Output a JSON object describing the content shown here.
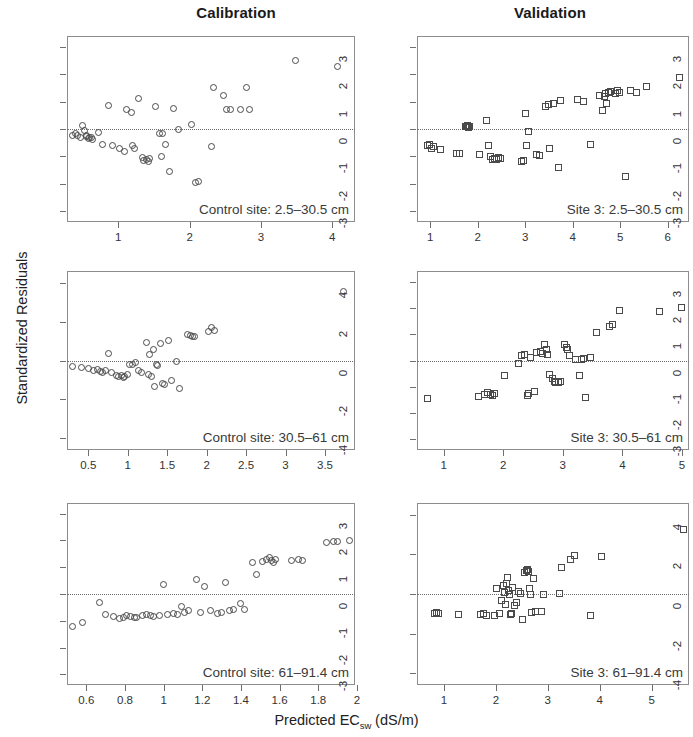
{
  "figure": {
    "column_titles": [
      "Calibration",
      "Validation"
    ],
    "ylabel": "Standardized Residuals",
    "xlabel_main": "Predicted EC",
    "xlabel_sub": "sw",
    "xlabel_unit": " (dS/m)"
  },
  "chart_data": [
    {
      "type": "scatter",
      "panel": "top-left",
      "title": "Calibration",
      "annotation": "Control site: 2.5–30.5 cm",
      "xlabel": "Predicted ECsw (dS/m)",
      "ylabel": "Standardized Residuals",
      "marker": "open-circle",
      "grid": false,
      "zero_reference_line": 0,
      "xlim": [
        0.28,
        4.32
      ],
      "ylim": [
        -3.4,
        3.4
      ],
      "xticks": [
        1,
        2,
        3,
        4
      ],
      "yticks": [
        3,
        2,
        1,
        0,
        -1,
        -2,
        -3
      ],
      "x": [
        0.36,
        0.4,
        0.43,
        0.47,
        0.5,
        0.52,
        0.55,
        0.56,
        0.58,
        0.6,
        0.62,
        0.64,
        0.72,
        0.78,
        0.86,
        0.92,
        1.02,
        1.08,
        1.12,
        1.18,
        1.2,
        1.22,
        1.28,
        1.34,
        1.36,
        1.4,
        1.42,
        1.44,
        1.52,
        1.58,
        1.6,
        1.62,
        1.66,
        1.72,
        1.78,
        1.84,
        2.02,
        2.08,
        2.12,
        2.3,
        2.34,
        2.48,
        2.52,
        2.58,
        2.72,
        2.8,
        2.84,
        3.48,
        4.08
      ],
      "y": [
        -0.22,
        -0.18,
        -0.25,
        -0.3,
        0.12,
        -0.05,
        -0.28,
        -0.22,
        -0.35,
        -0.3,
        -0.32,
        -0.38,
        -0.14,
        -0.55,
        0.85,
        -0.6,
        -0.7,
        -0.82,
        0.72,
        0.62,
        -0.62,
        -0.7,
        1.1,
        -1.05,
        -1.15,
        -1.12,
        -1.18,
        -1.08,
        0.82,
        -0.15,
        -1.02,
        -0.18,
        -0.58,
        -1.55,
        0.75,
        -0.02,
        0.18,
        -1.95,
        -1.92,
        -0.65,
        1.5,
        1.22,
        0.72,
        0.7,
        0.7,
        1.5,
        0.7,
        2.52,
        2.3
      ]
    },
    {
      "type": "scatter",
      "panel": "top-right",
      "title": "Validation",
      "annotation": "Site 3: 2.5–30.5 cm",
      "xlabel": "Predicted ECsw (dS/m)",
      "ylabel": "Standardized Residuals",
      "marker": "open-square",
      "grid": false,
      "zero_reference_line": 0,
      "xlim": [
        0.72,
        6.45
      ],
      "ylim": [
        -3.4,
        3.4
      ],
      "xticks": [
        1,
        2,
        3,
        4,
        5,
        6
      ],
      "yticks": [
        3,
        2,
        1,
        0,
        -1,
        -2,
        -3
      ],
      "x": [
        0.94,
        0.98,
        1.02,
        1.06,
        1.22,
        1.56,
        1.62,
        1.74,
        1.76,
        1.78,
        1.8,
        1.82,
        2.04,
        2.18,
        2.22,
        2.26,
        2.32,
        2.36,
        2.4,
        2.44,
        2.48,
        2.92,
        2.96,
        3.0,
        3.02,
        3.06,
        3.24,
        3.3,
        3.42,
        3.48,
        3.52,
        3.6,
        3.7,
        3.74,
        4.1,
        4.22,
        4.38,
        4.56,
        4.62,
        4.66,
        4.7,
        4.72,
        4.76,
        4.8,
        4.9,
        4.94,
        4.98,
        5.12,
        5.22,
        5.34,
        5.56,
        6.24
      ],
      "y": [
        -0.62,
        -0.58,
        -0.72,
        -0.65,
        -0.75,
        -0.88,
        -0.9,
        0.1,
        0.08,
        0.12,
        0.06,
        0.1,
        -0.95,
        0.3,
        -0.62,
        -1.02,
        -1.1,
        -1.08,
        -1.12,
        -1.05,
        -1.08,
        -1.18,
        -1.15,
        0.58,
        -0.6,
        -0.1,
        -0.92,
        -0.98,
        0.82,
        0.9,
        -0.72,
        0.92,
        -1.4,
        1.05,
        1.08,
        1.02,
        -0.58,
        1.22,
        0.68,
        1.18,
        1.3,
        0.92,
        1.35,
        1.38,
        1.3,
        1.4,
        1.35,
        -1.75,
        1.42,
        1.35,
        1.55,
        1.88
      ]
    },
    {
      "type": "scatter",
      "panel": "middle-left",
      "annotation": "Control site: 30.5–61 cm",
      "xlabel": "Predicted ECsw (dS/m)",
      "ylabel": "Standardized Residuals",
      "marker": "open-circle",
      "grid": false,
      "zero_reference_line": 0,
      "xlim": [
        0.23,
        3.88
      ],
      "ylim": [
        -4.6,
        4.6
      ],
      "xticks": [
        0.5,
        1.0,
        1.5,
        2.0,
        2.5,
        3.0,
        3.5
      ],
      "yticks": [
        4,
        2,
        0,
        -2,
        -4
      ],
      "x": [
        0.3,
        0.42,
        0.5,
        0.56,
        0.62,
        0.66,
        0.68,
        0.72,
        0.76,
        0.8,
        0.86,
        0.88,
        0.92,
        0.94,
        0.96,
        1.0,
        1.02,
        1.06,
        1.1,
        1.14,
        1.18,
        1.24,
        1.26,
        1.28,
        1.3,
        1.32,
        1.34,
        1.36,
        1.38,
        1.42,
        1.44,
        1.46,
        1.52,
        1.56,
        1.62,
        1.66,
        1.76,
        1.8,
        1.82,
        1.84,
        2.02,
        2.06,
        2.1,
        3.74
      ],
      "y": [
        -0.3,
        -0.35,
        -0.42,
        -0.5,
        -0.48,
        -0.55,
        -0.6,
        -0.52,
        0.38,
        -0.62,
        -0.78,
        -0.82,
        -0.75,
        -0.85,
        -0.8,
        -0.72,
        -0.18,
        -0.22,
        -0.1,
        -0.52,
        -0.6,
        0.92,
        -0.7,
        0.3,
        -0.82,
        0.58,
        -1.35,
        -0.2,
        -0.28,
        0.85,
        -1.18,
        -1.22,
        1.02,
        -1.05,
        -0.05,
        -1.45,
        1.35,
        1.28,
        1.22,
        1.25,
        1.48,
        1.68,
        1.52,
        3.55
      ]
    },
    {
      "type": "scatter",
      "panel": "middle-right",
      "annotation": "Site 3: 30.5–61 cm",
      "xlabel": "Predicted ECsw (dS/m)",
      "ylabel": "Standardized Residuals",
      "marker": "open-square",
      "grid": false,
      "zero_reference_line": 0,
      "xlim": [
        0.55,
        5.12
      ],
      "ylim": [
        -3.4,
        3.4
      ],
      "xticks": [
        1,
        2,
        3,
        4,
        5
      ],
      "yticks": [
        3,
        2,
        1,
        0,
        -1,
        -2,
        -3
      ],
      "x": [
        0.72,
        1.58,
        1.68,
        1.74,
        1.78,
        1.82,
        1.86,
        2.02,
        2.26,
        2.3,
        2.36,
        2.4,
        2.42,
        2.46,
        2.52,
        2.56,
        2.62,
        2.66,
        2.7,
        2.72,
        2.74,
        2.78,
        2.82,
        2.86,
        2.88,
        2.92,
        2.96,
        3.02,
        3.06,
        3.08,
        3.12,
        3.22,
        3.28,
        3.32,
        3.34,
        3.38,
        3.46,
        3.56,
        3.78,
        3.84,
        3.96,
        4.62,
        5.0
      ],
      "y": [
        -1.45,
        -1.35,
        -1.3,
        -1.22,
        -1.28,
        -1.32,
        -1.25,
        -0.58,
        -0.12,
        0.18,
        0.22,
        -1.32,
        -1.25,
        0.1,
        -1.18,
        0.3,
        0.35,
        0.28,
        0.62,
        0.42,
        0.22,
        -0.52,
        -0.68,
        -0.78,
        -0.82,
        -0.85,
        -0.8,
        0.62,
        0.5,
        0.42,
        0.18,
        0.02,
        -0.58,
        0.05,
        0.08,
        -1.4,
        0.1,
        1.05,
        1.28,
        1.38,
        1.9,
        1.88,
        2.02
      ]
    },
    {
      "type": "scatter",
      "panel": "bottom-left",
      "annotation": "Control site: 61–91.4 cm",
      "xlabel": "Predicted ECsw (dS/m)",
      "ylabel": "Standardized Residuals",
      "marker": "open-circle",
      "grid": false,
      "zero_reference_line": 0,
      "xlim": [
        0.5,
        1.99
      ],
      "ylim": [
        -3.4,
        3.4
      ],
      "xticks": [
        0.6,
        0.8,
        1.0,
        1.2,
        1.4,
        1.6,
        1.8,
        2.0
      ],
      "yticks": [
        3,
        2,
        1,
        0,
        -1,
        -2,
        -3
      ],
      "x": [
        0.53,
        0.58,
        0.67,
        0.7,
        0.74,
        0.77,
        0.79,
        0.81,
        0.83,
        0.85,
        0.86,
        0.89,
        0.91,
        0.93,
        0.95,
        0.98,
        1.0,
        1.02,
        1.05,
        1.07,
        1.09,
        1.11,
        1.13,
        1.17,
        1.19,
        1.21,
        1.24,
        1.28,
        1.3,
        1.32,
        1.34,
        1.36,
        1.4,
        1.42,
        1.46,
        1.48,
        1.51,
        1.53,
        1.55,
        1.56,
        1.57,
        1.58,
        1.66,
        1.7,
        1.72,
        1.84,
        1.88,
        1.9,
        1.96
      ],
      "y": [
        -1.2,
        -1.08,
        -0.32,
        -0.78,
        -0.85,
        -0.92,
        -0.88,
        -0.82,
        -0.85,
        -0.88,
        -0.86,
        -0.8,
        -0.78,
        -0.82,
        -0.85,
        -0.8,
        0.35,
        -0.75,
        -0.72,
        -0.78,
        -0.48,
        -0.7,
        -0.62,
        0.55,
        -0.68,
        0.28,
        -0.62,
        -0.72,
        -0.68,
        0.42,
        -0.62,
        -0.58,
        -0.35,
        -0.58,
        1.18,
        0.72,
        1.22,
        1.28,
        1.35,
        1.25,
        1.18,
        1.3,
        1.25,
        1.28,
        1.25,
        1.92,
        1.95,
        1.98,
        2.0
      ]
    },
    {
      "type": "scatter",
      "panel": "bottom-right",
      "annotation": "Site 3: 61–91.4 cm",
      "xlabel": "Predicted ECsw (dS/m)",
      "ylabel": "Standardized Residuals",
      "marker": "open-square",
      "grid": false,
      "zero_reference_line": 0,
      "xlim": [
        0.48,
        5.72
      ],
      "ylim": [
        -4.6,
        4.6
      ],
      "xticks": [
        1,
        2,
        3,
        4,
        5
      ],
      "yticks": [
        4,
        2,
        0,
        -2,
        -4
      ],
      "x": [
        0.82,
        0.86,
        0.9,
        1.28,
        1.7,
        1.76,
        1.82,
        1.98,
        2.02,
        2.06,
        2.1,
        2.14,
        2.16,
        2.18,
        2.2,
        2.22,
        2.24,
        2.26,
        2.28,
        2.3,
        2.32,
        2.36,
        2.4,
        2.44,
        2.48,
        2.52,
        2.56,
        2.58,
        2.6,
        2.62,
        2.64,
        2.66,
        2.68,
        2.72,
        2.76,
        2.88,
        2.92,
        3.22,
        3.26,
        3.44,
        3.52,
        3.82,
        4.04,
        5.62
      ],
      "y": [
        -1.0,
        -0.96,
        -1.0,
        -1.02,
        -1.05,
        -1.0,
        -1.08,
        -1.1,
        0.28,
        -0.98,
        -0.35,
        0.42,
        0.08,
        -0.52,
        0.55,
        0.82,
        0.2,
        -0.02,
        -1.05,
        -1.0,
        0.35,
        -0.58,
        -0.45,
        0.12,
        0.02,
        -1.3,
        1.1,
        1.18,
        1.22,
        1.15,
        0.3,
        -0.05,
        -0.92,
        0.78,
        -0.88,
        -0.88,
        -0.05,
        0.02,
        1.35,
        1.72,
        1.95,
        -1.1,
        1.88,
        3.28
      ]
    }
  ]
}
